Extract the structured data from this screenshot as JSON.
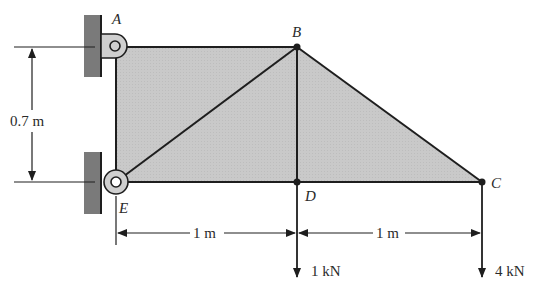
{
  "diagram": {
    "type": "truss",
    "nodes": {
      "A": {
        "label": "A",
        "support": "pin"
      },
      "B": {
        "label": "B"
      },
      "C": {
        "label": "C"
      },
      "D": {
        "label": "D"
      },
      "E": {
        "label": "E",
        "support": "pin"
      }
    },
    "members": [
      "A-B",
      "A-E",
      "E-B",
      "B-D",
      "E-D",
      "D-C",
      "B-C"
    ],
    "dimensions": {
      "height": "0.7 m",
      "span_ED": "1 m",
      "span_DC": "1 m"
    },
    "loads": {
      "D": "1 kN",
      "C": "4 kN"
    },
    "colors": {
      "fill": "#c8c8c8",
      "wall": "#7a7a7a",
      "line": "#1e1e1e",
      "pin_fill": "#cfcfcf"
    }
  }
}
